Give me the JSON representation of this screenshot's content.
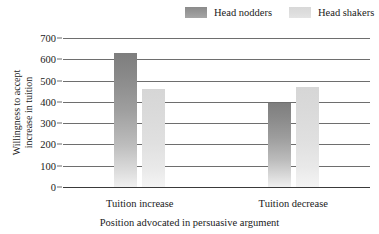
{
  "chart_data": {
    "type": "bar",
    "title": "",
    "subtitle": "",
    "xlabel": "Position advocated in persuasive argument",
    "ylabel_line1": "Willingness to accept",
    "ylabel_line2": "increase in tuition",
    "categories": [
      "Tuition increase",
      "Tuition decrease"
    ],
    "series": [
      {
        "name": "Head nodders",
        "values": [
          630,
          395
        ],
        "color": "#8f8f8f"
      },
      {
        "name": "Head shakers",
        "values": [
          460,
          470
        ],
        "color": "#dcdcdc"
      }
    ],
    "ylim": [
      0,
      700
    ],
    "yticks": [
      700,
      600,
      500,
      400,
      300,
      200,
      100,
      0
    ],
    "grid": true,
    "legend_position": "top-right"
  }
}
